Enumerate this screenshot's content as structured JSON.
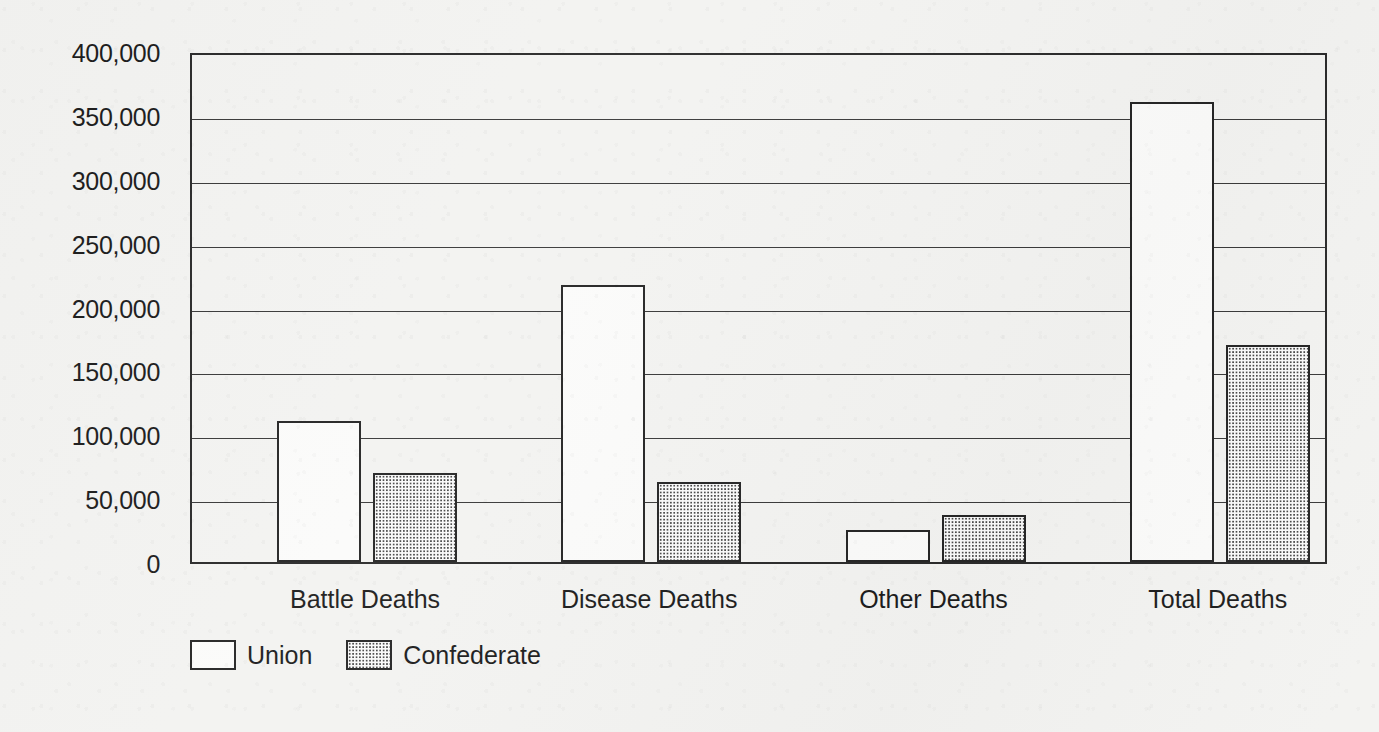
{
  "chart_data": {
    "type": "bar",
    "title": "",
    "subtitle": "",
    "xlabel": "",
    "ylabel": "",
    "categories": [
      "Battle Deaths",
      "Disease Deaths",
      "Other Deaths",
      "Total Deaths"
    ],
    "series": [
      {
        "name": "Union",
        "values": [
          110000,
          217000,
          25000,
          360000
        ]
      },
      {
        "name": "Confederate",
        "values": [
          70000,
          63000,
          37000,
          170000
        ]
      }
    ],
    "ylim": [
      0,
      400000
    ],
    "ytick_values": [
      0,
      50000,
      100000,
      150000,
      200000,
      250000,
      300000,
      350000,
      400000
    ],
    "ytick_labels": [
      "0",
      "50,000",
      "100,000",
      "150,000",
      "200,000",
      "250,000",
      "300,000",
      "350,000",
      "400,000"
    ],
    "grid": true,
    "grid_axis": "y",
    "legend_position": "bottom-left",
    "legend_entries": [
      "Union",
      "Confederate"
    ],
    "series_styles": [
      "white-outline",
      "dotted-stipple"
    ],
    "colors": {
      "background": "#f3f3f1",
      "axis": "#2b2b2b",
      "gridline": "#3a3a3a",
      "text": "#1d1d1d",
      "union_fill": "#fbfbfa",
      "confederate_fill": "#fafafa",
      "confederate_dots": "#4a4a4a"
    }
  }
}
